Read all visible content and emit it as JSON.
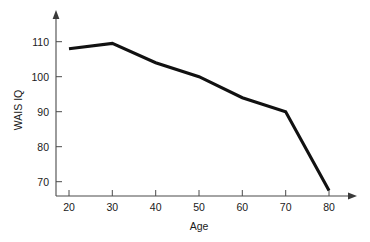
{
  "chart_data": {
    "type": "line",
    "title": "",
    "xlabel": "Age",
    "ylabel": "WAIS IQ",
    "x": [
      20,
      30,
      40,
      50,
      60,
      70,
      80
    ],
    "values": [
      108,
      109.5,
      104,
      100,
      94,
      90,
      67.5
    ],
    "series": [
      {
        "name": "WAIS IQ",
        "values": [
          108,
          109.5,
          104,
          100,
          94,
          90,
          67.5
        ],
        "color": "#111111"
      }
    ],
    "xlim": [
      15,
      85
    ],
    "ylim": [
      63,
      115
    ],
    "xticks": [
      20,
      30,
      40,
      50,
      60,
      70,
      80
    ],
    "yticks": [
      70,
      80,
      90,
      100,
      110
    ],
    "xtick_labels": [
      "20",
      "30",
      "40",
      "50",
      "60",
      "70",
      "80"
    ],
    "ytick_labels": [
      "70",
      "80",
      "90",
      "100",
      "110"
    ],
    "grid": false,
    "legend": false,
    "legend_position": "none",
    "axis_arrows": true
  },
  "axes": {
    "x_axis_label": "Age",
    "y_axis_label": "WAIS IQ",
    "x_tick_labels": [
      "20",
      "30",
      "40",
      "50",
      "60",
      "70",
      "80"
    ],
    "y_tick_labels": [
      "70",
      "80",
      "90",
      "100",
      "110"
    ]
  },
  "colors": {
    "line": "#111111",
    "axis": "#4a4a4a",
    "text": "#1a1a1a",
    "background": "#ffffff"
  }
}
